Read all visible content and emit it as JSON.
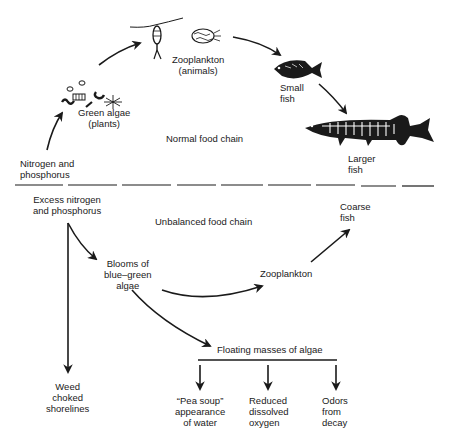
{
  "diagram": {
    "sections": {
      "normal": {
        "title": "Normal food chain",
        "nodes": {
          "nutrients": {
            "line1": "Nitrogen and",
            "line2": "phosphorus"
          },
          "algae": {
            "line1": "Green algae",
            "line2": "(plants)"
          },
          "zooplankton": {
            "line1": "Zooplankton",
            "line2": "(animals)"
          },
          "small_fish": {
            "line1": "Small",
            "line2": "fish"
          },
          "larger_fish": {
            "line1": "Larger",
            "line2": "fish"
          }
        }
      },
      "unbalanced": {
        "title": "Unbalanced food chain",
        "nodes": {
          "excess": {
            "line1": "Excess nitrogen",
            "line2": "and phosphorus"
          },
          "blooms": {
            "line1": "Blooms of",
            "line2": "blue–green",
            "line3": "algae"
          },
          "zooplankton": {
            "line1": "Zooplankton"
          },
          "coarse_fish": {
            "line1": "Coarse",
            "line2": "fish"
          },
          "weed": {
            "line1": "Weed",
            "line2": "choked",
            "line3": "shorelines"
          },
          "floating": {
            "line1": "Floating masses of algae"
          },
          "pea_soup": {
            "line1": "“Pea soup”",
            "line2": "appearance",
            "line3": "of water"
          },
          "oxygen": {
            "line1": "Reduced",
            "line2": "dissolved",
            "line3": "oxygen"
          },
          "odors": {
            "line1": "Odors",
            "line2": "from",
            "line3": "decay"
          }
        }
      }
    },
    "icons": [
      "algae-cluster-icon",
      "copepod-icon",
      "rotifer-icon",
      "small-fish-icon",
      "pike-icon"
    ],
    "colors": {
      "ink": "#1a1a1a",
      "background": "#ffffff"
    }
  }
}
